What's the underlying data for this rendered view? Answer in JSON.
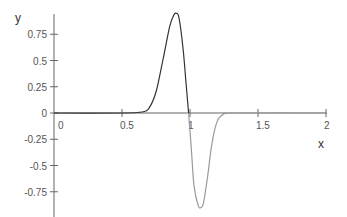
{
  "chart_data": {
    "type": "line",
    "title": "",
    "xlabel": "x",
    "ylabel": "y",
    "xlim": [
      -0.05,
      2.05
    ],
    "ylim": [
      -0.97,
      1.0
    ],
    "grid": false,
    "legend": null,
    "x_ticks": [
      0,
      0.5,
      1,
      1.5,
      2
    ],
    "x_tick_labels": [
      "0",
      "0.5",
      "1",
      "1.5",
      "2"
    ],
    "y_ticks": [
      0.75,
      0.5,
      0.25,
      0,
      -0.25,
      -0.5,
      -0.75
    ],
    "y_tick_labels": [
      "0.75",
      "0.5",
      "0.25",
      "0",
      "-0.25",
      "-0.5",
      "-0.75"
    ],
    "series": [
      {
        "name": "positive lobe",
        "color": "#333333",
        "x": [
          0,
          0.5,
          0.65,
          0.7,
          0.75,
          0.8,
          0.85,
          0.88,
          0.9,
          0.92,
          0.95,
          0.97,
          0.99
        ],
        "y": [
          0,
          0,
          0.01,
          0.05,
          0.2,
          0.5,
          0.82,
          0.93,
          0.95,
          0.9,
          0.6,
          0.3,
          0.0
        ]
      },
      {
        "name": "negative lobe",
        "color": "#999999",
        "x": [
          0.99,
          1.01,
          1.03,
          1.06,
          1.08,
          1.1,
          1.13,
          1.16,
          1.2,
          1.25,
          1.32,
          2.0
        ],
        "y": [
          0.0,
          -0.35,
          -0.7,
          -0.88,
          -0.9,
          -0.85,
          -0.6,
          -0.3,
          -0.08,
          -0.01,
          0,
          0
        ]
      }
    ]
  }
}
